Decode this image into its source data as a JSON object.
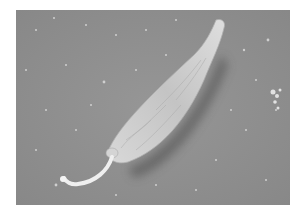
{
  "image": {
    "description": "Scanning electron micrograph of a spindle-shaped flagellated protozoan (promastigote) on a gray substrate",
    "colors": {
      "background": "#ffffff",
      "substrate": "#8e8e8e",
      "cell_body": "#c8c8c8",
      "cell_highlight": "#e6e6e6",
      "shadow": "#5a5a5a",
      "flagellum": "#eeeeee"
    }
  }
}
